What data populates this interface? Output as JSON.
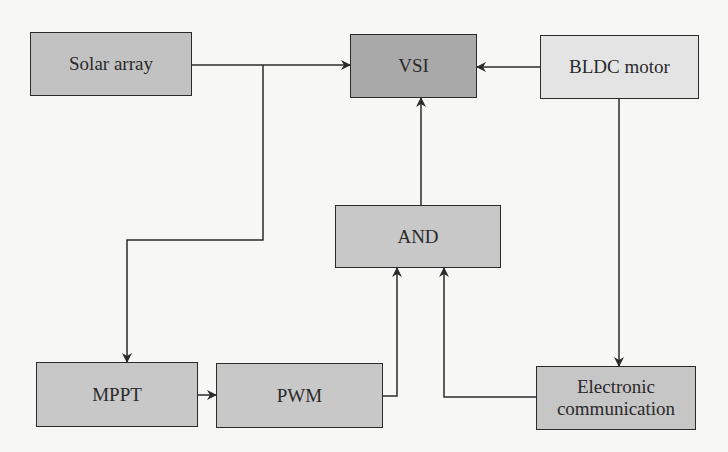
{
  "diagram": {
    "type": "block-diagram",
    "colors": {
      "background": "#f7f7f5",
      "line": "#2b2b2b",
      "solar_fill": "#c2c2c2",
      "vsi_fill": "#a9a9a9",
      "bldc_fill": "#e4e4e4",
      "and_fill": "#c8c8c8",
      "mppt_fill": "#c8c8c8",
      "pwm_fill": "#c8c8c8",
      "ec_fill": "#c6c6c6"
    },
    "blocks": {
      "solar": {
        "label": "Solar array"
      },
      "vsi": {
        "label": "VSI"
      },
      "bldc": {
        "label": "BLDC motor"
      },
      "and": {
        "label": "AND"
      },
      "mppt": {
        "label": "MPPT"
      },
      "pwm": {
        "label": "PWM"
      },
      "ec": {
        "label_line1": "Electronic",
        "label_line2": "communication"
      }
    },
    "connections": [
      {
        "from": "Solar array",
        "to": "VSI"
      },
      {
        "from": "BLDC motor",
        "to": "VSI"
      },
      {
        "from": "Solar array",
        "to": "MPPT"
      },
      {
        "from": "MPPT",
        "to": "PWM"
      },
      {
        "from": "PWM",
        "to": "AND"
      },
      {
        "from": "Electronic communication",
        "to": "AND"
      },
      {
        "from": "AND",
        "to": "VSI"
      },
      {
        "from": "BLDC motor",
        "to": "Electronic communication"
      }
    ]
  }
}
